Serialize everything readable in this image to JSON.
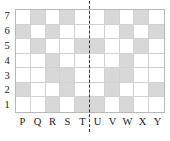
{
  "figure": {
    "name": "reflection-symmetry-grid",
    "width": 170,
    "height": 141,
    "background_color": "#ffffff"
  },
  "colors": {
    "shaded_cell": "#d8d8d8",
    "empty_cell": "#ffffff",
    "grid_line": "#d2d2d2",
    "grid_border": "#b9b9b9",
    "mirror_line": "#3a3a3a",
    "label_text": "#1a1a1a"
  },
  "axes": {
    "x_labels": [
      "P",
      "Q",
      "R",
      "S",
      "T",
      "U",
      "V",
      "W",
      "X",
      "Y"
    ],
    "y_labels": [
      "7",
      "6",
      "5",
      "4",
      "3",
      "2",
      "1"
    ]
  },
  "mirror_line": {
    "style": "dashed",
    "orientation": "vertical",
    "between_columns": [
      "T",
      "U"
    ]
  },
  "chart_data": {
    "type": "heatmap",
    "title": "",
    "xlabel": "",
    "ylabel": "",
    "columns": [
      "P",
      "Q",
      "R",
      "S",
      "T",
      "U",
      "V",
      "W",
      "X",
      "Y"
    ],
    "rows": [
      "7",
      "6",
      "5",
      "4",
      "3",
      "2",
      "1"
    ],
    "legend": [
      "shaded",
      "empty"
    ],
    "grid": true,
    "note": "1 = shaded cell, 0 = empty cell; rows listed top (7) to bottom (1)",
    "values": [
      [
        0,
        1,
        0,
        1,
        0,
        0,
        1,
        0,
        1,
        0
      ],
      [
        1,
        0,
        1,
        0,
        0,
        0,
        0,
        1,
        0,
        1
      ],
      [
        0,
        1,
        0,
        0,
        1,
        1,
        0,
        0,
        1,
        0
      ],
      [
        0,
        0,
        1,
        0,
        0,
        0,
        0,
        1,
        0,
        0
      ],
      [
        0,
        0,
        1,
        1,
        0,
        0,
        1,
        1,
        0,
        0
      ],
      [
        1,
        0,
        0,
        1,
        0,
        0,
        1,
        0,
        0,
        1
      ],
      [
        0,
        0,
        1,
        0,
        1,
        1,
        0,
        1,
        0,
        0
      ]
    ],
    "shaded_cells": [
      "Q7",
      "S7",
      "V7",
      "X7",
      "P6",
      "R6",
      "W6",
      "Y6",
      "Q5",
      "T5",
      "U5",
      "X5",
      "R4",
      "W4",
      "R3",
      "S3",
      "V3",
      "W3",
      "P2",
      "S2",
      "V2",
      "Y2",
      "R1",
      "T1",
      "U1",
      "W1"
    ]
  }
}
